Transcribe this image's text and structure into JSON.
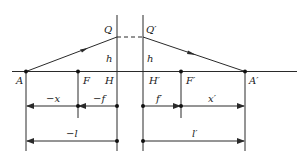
{
  "diagram": {
    "type": "optical-system-principal-planes",
    "colors": {
      "stroke": "#2a2a2a",
      "text": "#222222",
      "background": "#ffffff"
    },
    "points": {
      "A": "A",
      "F": "F",
      "H": "H",
      "H_prime": "H′",
      "F_prime": "F′",
      "A_prime": "A′",
      "Q": "Q",
      "Q_prime": "Q′"
    },
    "heights": {
      "h_left": "h",
      "h_right": "h"
    },
    "dimensions": {
      "minus_x": "−x",
      "minus_f": "−f",
      "f_prime": "f′",
      "x_prime": "x′",
      "minus_l": "−l",
      "l_prime": "l′"
    }
  }
}
